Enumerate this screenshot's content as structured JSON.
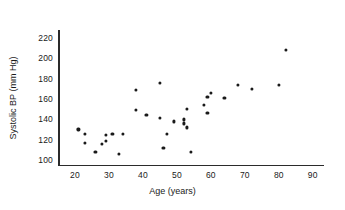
{
  "chart_data": {
    "type": "scatter",
    "title": "",
    "xlabel": "Age (years)",
    "ylabel": "Systolic BP (mm Hg)",
    "xlim": [
      15,
      93
    ],
    "ylim": [
      95,
      228
    ],
    "xticks": [
      20,
      30,
      40,
      50,
      60,
      70,
      80,
      90
    ],
    "yticks": [
      100,
      120,
      140,
      160,
      180,
      200,
      220
    ],
    "grid": false,
    "legend": null,
    "marker": "filled-circle",
    "marker_color": "#1a1a1a",
    "series": [
      {
        "name": "subjects",
        "points": [
          [
            21,
            130
          ],
          [
            23,
            126
          ],
          [
            23,
            117
          ],
          [
            26,
            108
          ],
          [
            28,
            116
          ],
          [
            29,
            119
          ],
          [
            29,
            125
          ],
          [
            31,
            126
          ],
          [
            33,
            106
          ],
          [
            34,
            126
          ],
          [
            38,
            169
          ],
          [
            38,
            149
          ],
          [
            41,
            144
          ],
          [
            45,
            176
          ],
          [
            45,
            141
          ],
          [
            46,
            112
          ],
          [
            47,
            126
          ],
          [
            49,
            138
          ],
          [
            52,
            140
          ],
          [
            52,
            136
          ],
          [
            53,
            150
          ],
          [
            53,
            132
          ],
          [
            54,
            108
          ],
          [
            58,
            154
          ],
          [
            59,
            146
          ],
          [
            59,
            162
          ],
          [
            60,
            166
          ],
          [
            64,
            161
          ],
          [
            68,
            174
          ],
          [
            72,
            170
          ],
          [
            80,
            174
          ],
          [
            82,
            208
          ]
        ]
      }
    ]
  },
  "axes": {
    "y_tick_labels": [
      "220",
      "200",
      "180",
      "160",
      "140",
      "120",
      "100"
    ],
    "x_tick_labels": [
      "20",
      "30",
      "40",
      "50",
      "60",
      "70",
      "80",
      "90"
    ],
    "x_axis_title": "Age (years)",
    "y_axis_title": "Systolic BP (mm Hg)"
  }
}
